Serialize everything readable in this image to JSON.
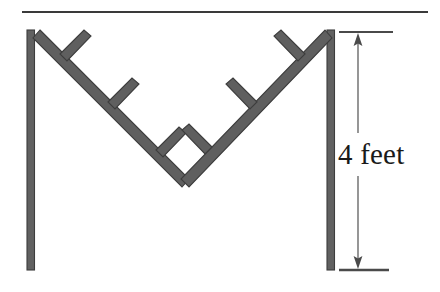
{
  "figure": {
    "background_color": "#ffffff",
    "width": 440,
    "height": 292
  },
  "annotation": {
    "dimension_label": "4 feet",
    "value": 4,
    "unit": "feet",
    "text_color": "#1a1a1a"
  },
  "colors": {
    "beam": "#5f5f5f",
    "beam_outline": "#3d3d3d",
    "post": "#616161",
    "post_outline": "#3d3d3d",
    "rule": "#3a3a3a",
    "dimension_line": "#6a6a6a",
    "tick": "#4a4a4a"
  },
  "geometry": {
    "top_rule": {
      "x1": 22,
      "y1": 12,
      "x2": 428,
      "y2": 12
    },
    "left_post": {
      "x": 30,
      "y_top": 30,
      "y_bottom": 270,
      "width": 7
    },
    "right_post": {
      "x": 330,
      "y_top": 30,
      "y_bottom": 270,
      "width": 7
    },
    "vee": {
      "left_top": {
        "x": 40,
        "y": 32
      },
      "apex": {
        "x": 185,
        "y": 178
      },
      "right_top": {
        "x": 325,
        "y": 32
      },
      "thickness": 9
    },
    "left_branches": [
      {
        "base_x": 64,
        "base_y": 57,
        "tip_x": 86,
        "tip_y": 35
      },
      {
        "base_x": 112,
        "base_y": 105,
        "tip_x": 134,
        "tip_y": 83
      },
      {
        "base_x": 160,
        "base_y": 153,
        "tip_x": 182,
        "tip_y": 131
      }
    ],
    "right_branches": [
      {
        "base_x": 301,
        "base_y": 57,
        "tip_x": 279,
        "tip_y": 35
      },
      {
        "base_x": 253,
        "base_y": 105,
        "tip_x": 231,
        "tip_y": 83
      },
      {
        "base_x": 208,
        "base_y": 150,
        "tip_x": 186,
        "tip_y": 128
      }
    ],
    "dimension": {
      "line_x": 358,
      "y_top": 33,
      "y_bottom": 270,
      "tick_top": {
        "x1": 340,
        "x2": 392,
        "y": 32
      },
      "tick_bottom": {
        "x1": 340,
        "x2": 388,
        "y": 270
      },
      "arrow_size": 8
    }
  }
}
